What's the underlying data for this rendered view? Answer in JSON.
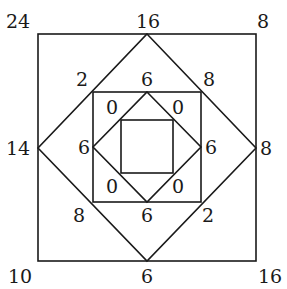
{
  "diagram": {
    "line_color": "#1a1a1a",
    "background": "#ffffff",
    "outer_square": {
      "corners": {
        "top_left": "24",
        "top_right": "8",
        "bottom_left": "10",
        "bottom_right": "16"
      }
    },
    "outer_diamond": {
      "vertices": {
        "top": "16",
        "right": "8",
        "bottom": "6",
        "left": "14"
      }
    },
    "middle_square": {
      "corners": {
        "top_left": "2",
        "top_right": "8",
        "bottom_left": "8",
        "bottom_right": "2"
      }
    },
    "middle_diamond": {
      "vertices": {
        "top": "6",
        "right": "6",
        "bottom": "6",
        "left": "6"
      }
    },
    "inner_square_region": {
      "corners": {
        "top_left": "0",
        "top_right": "0",
        "bottom_left": "0",
        "bottom_right": "0"
      }
    }
  }
}
